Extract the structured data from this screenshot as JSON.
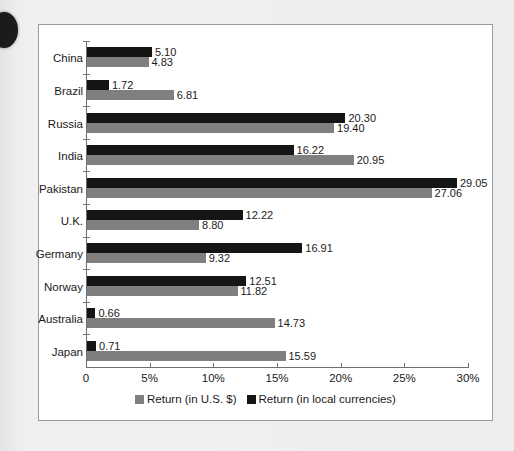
{
  "chart_data": {
    "type": "bar",
    "orientation": "horizontal",
    "title": "",
    "xlabel": "",
    "ylabel": "",
    "xlim": [
      0,
      30
    ],
    "xticks": [
      "0",
      "5%",
      "10%",
      "15%",
      "20%",
      "25%",
      "30%"
    ],
    "xtick_values": [
      0,
      5,
      10,
      15,
      20,
      25,
      30
    ],
    "grid": false,
    "legend_position": "bottom",
    "categories": [
      "China",
      "Brazil",
      "Russia",
      "India",
      "Pakistan",
      "U.K.",
      "Germany",
      "Norway",
      "Australia",
      "Japan"
    ],
    "series": [
      {
        "name": "Return (in local currencies)",
        "color": "#151515",
        "values": [
          5.1,
          1.72,
          20.3,
          16.22,
          29.05,
          12.22,
          16.91,
          12.51,
          0.66,
          0.71
        ],
        "labels": [
          "5.10",
          "1.72",
          "20.30",
          "16.22",
          "29.05",
          "12.22",
          "16.91",
          "12.51",
          "0.66",
          "0.71"
        ]
      },
      {
        "name": "Return (in U.S. $)",
        "color": "#7f7f7f",
        "values": [
          4.83,
          6.81,
          19.4,
          20.95,
          27.06,
          8.8,
          9.32,
          11.82,
          14.73,
          15.59
        ],
        "labels": [
          "4.83",
          "6.81",
          "19.40",
          "20.95",
          "27.06",
          "8.80",
          "9.32",
          "11.82",
          "14.73",
          "15.59"
        ]
      }
    ]
  },
  "legend": {
    "items": [
      {
        "label": "Return (in U.S. $)",
        "color": "#7f7f7f"
      },
      {
        "label": "Return (in local currencies)",
        "color": "#151515"
      }
    ]
  }
}
